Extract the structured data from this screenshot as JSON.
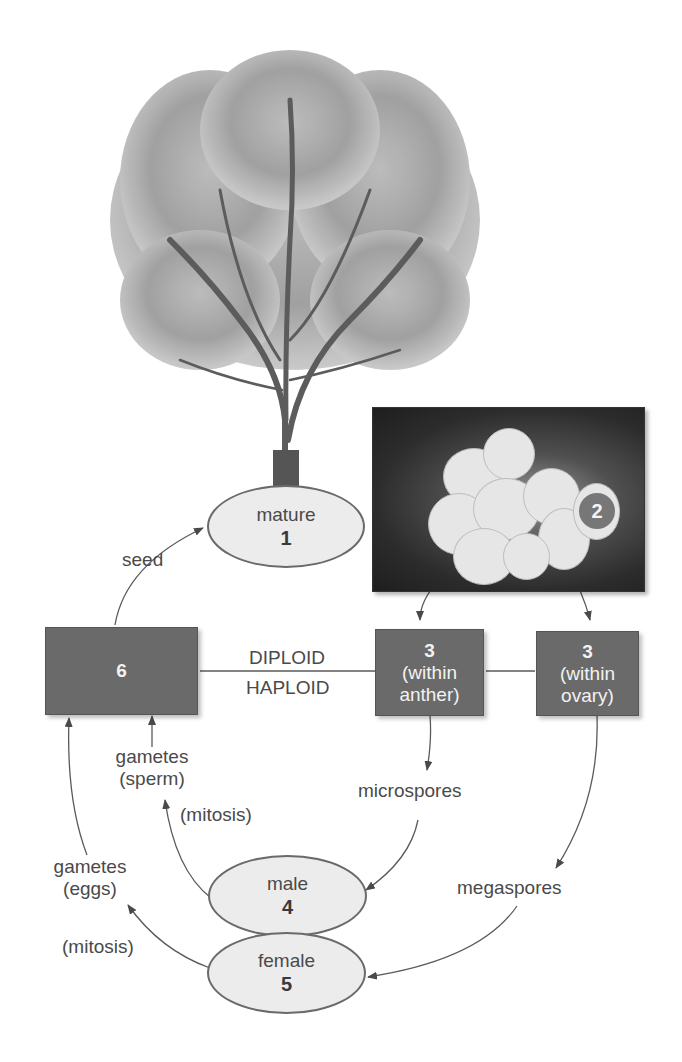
{
  "diagram": {
    "nodes": {
      "mature": {
        "label": "mature",
        "number": "1"
      },
      "flower": {
        "number": "2"
      },
      "anther": {
        "number": "3",
        "label": "(within",
        "label2": "anther)"
      },
      "ovary": {
        "number": "3",
        "label": "(within",
        "label2": "ovary)"
      },
      "male": {
        "label": "male",
        "number": "4"
      },
      "female": {
        "label": "female",
        "number": "5"
      },
      "zygote": {
        "number": "6"
      }
    },
    "labels": {
      "seed": "seed",
      "diploid": "DIPLOID",
      "haploid": "HAPLOID",
      "microspores": "microspores",
      "megaspores": "megaspores",
      "gametes_sperm_1": "gametes",
      "gametes_sperm_2": "(sperm)",
      "gametes_eggs_1": "gametes",
      "gametes_eggs_2": "(eggs)",
      "mitosis_male": "(mitosis)",
      "mitosis_female": "(mitosis)"
    },
    "colors": {
      "box_fill": "#6a6a6a",
      "ellipse_fill": "#ececec",
      "line": "#5a5a5a",
      "text": "#4a4a4a"
    }
  }
}
